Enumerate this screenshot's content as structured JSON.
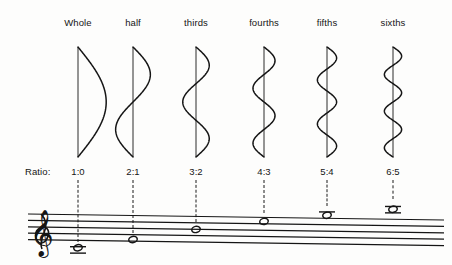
{
  "figure": {
    "ratio_caption": "Ratio:",
    "ink_color": "#151515",
    "background_color": "#fdfdfc"
  },
  "columns": [
    {
      "label": "Whole",
      "ratio": "1:0",
      "mode_number": 1,
      "lobes": 1,
      "x": 78,
      "note_staff_position": "below-staff-two-ledger",
      "note_y": 247,
      "ledger_lines_below": 2,
      "ledger_lines_above": 0
    },
    {
      "label": "half",
      "ratio": "2:1",
      "mode_number": 2,
      "lobes": 2,
      "x": 133,
      "note_staff_position": "second-line-from-bottom",
      "note_y": 238,
      "ledger_lines_below": 0,
      "ledger_lines_above": 0
    },
    {
      "label": "thirds",
      "ratio": "3:2",
      "mode_number": 3,
      "lobes": 3,
      "x": 196,
      "note_staff_position": "middle-line",
      "note_y": 227,
      "ledger_lines_below": 0,
      "ledger_lines_above": 0
    },
    {
      "label": "fourths",
      "ratio": "4:3",
      "mode_number": 4,
      "lobes": 4,
      "x": 264,
      "note_staff_position": "top-line",
      "note_y": 218,
      "ledger_lines_below": 0,
      "ledger_lines_above": 0
    },
    {
      "label": "fifths",
      "ratio": "5:4",
      "mode_number": 5,
      "lobes": 5,
      "x": 327,
      "note_staff_position": "above-staff-one-ledger",
      "note_y": 211,
      "ledger_lines_below": 0,
      "ledger_lines_above": 1
    },
    {
      "label": "sixths",
      "ratio": "6:5",
      "mode_number": 6,
      "lobes": 6,
      "x": 393,
      "note_staff_position": "above-staff-two-ledger",
      "note_y": 204,
      "ledger_lines_below": 0,
      "ledger_lines_above": 2
    }
  ],
  "staff": {
    "line_count": 5,
    "clef": "treble-clef",
    "left_x": 28,
    "right_x": 444,
    "top_y_left": 214,
    "line_spacing": 6.4,
    "tilt_px": 6,
    "note_head_type": "whole-note"
  },
  "chart_data": {
    "type": "diagram",
    "categories": [
      "Whole",
      "half",
      "thirds",
      "fourths",
      "fifths",
      "sixths"
    ],
    "ratios": [
      "1:0",
      "2:1",
      "3:2",
      "4:3",
      "5:4",
      "6:5"
    ],
    "mode_numbers": [
      1,
      2,
      3,
      4,
      5,
      6
    ],
    "lobe_counts": [
      1,
      2,
      3,
      4,
      5,
      6
    ],
    "node_counts": [
      0,
      1,
      2,
      3,
      4,
      5
    ],
    "note_pitch_rank": [
      1,
      2,
      3,
      4,
      5,
      6
    ],
    "xlabel": "",
    "ylabel": "",
    "legend": []
  }
}
